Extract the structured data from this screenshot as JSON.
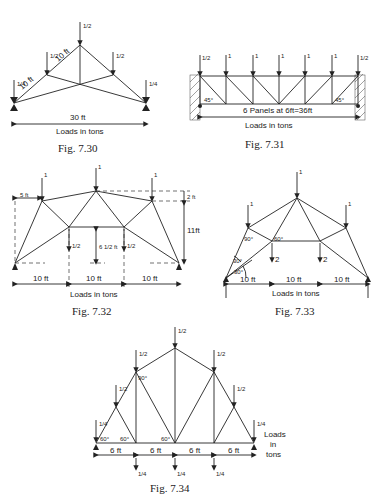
{
  "figures": [
    {
      "id": "fig-7-30",
      "caption": "Fig. 7.30",
      "labels": {
        "span": "30 ft",
        "member1": "10 ft",
        "member2": "10 ft",
        "loads_note": "Loads in tons"
      },
      "loads": {
        "apex": "1/2",
        "left_mid": "1/2",
        "right_mid": "1/2",
        "left_support": "1/4",
        "right_support": "1/4"
      }
    },
    {
      "id": "fig-7-31",
      "caption": "Fig. 7.31",
      "labels": {
        "span": "6 Panels at 6ft=36ft",
        "loads_note": "Loads in tons",
        "angle_left": "45°",
        "angle_right": "45°"
      },
      "loads": {
        "end_left": "1/2",
        "end_right": "1/2",
        "interior": [
          "1",
          "1",
          "1",
          "1",
          "1"
        ]
      }
    },
    {
      "id": "fig-7-32",
      "caption": "Fig. 7.32",
      "labels": {
        "offset": "5 ft",
        "rise": "2 ft",
        "height": "11ft",
        "inner_height": "6 1/2 ft",
        "spans": [
          "10 ft",
          "10 ft",
          "10 ft"
        ],
        "loads_note": "Loads in tons"
      },
      "loads": {
        "top": [
          "1",
          "1",
          "1"
        ],
        "bottom": [
          "1/2",
          "1/2"
        ]
      }
    },
    {
      "id": "fig-7-33",
      "caption": "Fig. 7.33",
      "labels": {
        "angle_90": "90°",
        "angle_60": "60°",
        "angle_30a": "30°",
        "angle_30b": "30°",
        "spans": [
          "10 ft",
          "10 ft",
          "10 ft"
        ],
        "loads_note": "Loads in tons"
      },
      "loads": {
        "top": [
          "1",
          "1",
          "1"
        ],
        "bottom": [
          "2",
          "2"
        ]
      }
    },
    {
      "id": "fig-7-34",
      "caption": "Fig. 7.34",
      "labels": {
        "angle_90": "90°",
        "angle_60a": "60°",
        "angle_60b": "60°",
        "angle_60c": "60°",
        "spans": [
          "6 ft",
          "6 ft",
          "6 ft",
          "6 ft"
        ],
        "loads_note_1": "Loads",
        "loads_note_2": "in",
        "loads_note_3": "tons"
      },
      "loads": {
        "apex": "1/2",
        "upper": [
          "1/2",
          "1/2"
        ],
        "lower": [
          "1/2",
          "1/2"
        ],
        "ends": [
          "1/4",
          "1/4"
        ],
        "bottom": [
          "1/4",
          "1/4",
          "1/4"
        ]
      }
    }
  ]
}
